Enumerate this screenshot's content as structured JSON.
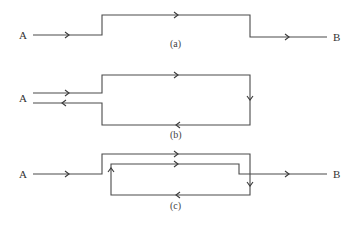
{
  "diagram": {
    "type": "circuit-path-diagram",
    "colors": {
      "line": "#4a4a4a",
      "text": "#333333",
      "background": "#ffffff"
    },
    "panels": [
      {
        "id": "a",
        "caption": "(a)",
        "start_label": "A",
        "end_label": "B",
        "description": "Single path from A stepping up, across the top, stepping down to B"
      },
      {
        "id": "b",
        "caption": "(b)",
        "start_label": "A",
        "description": "Closed loop: from A right along top, down right side, back along bottom to A"
      },
      {
        "id": "c",
        "caption": "(c)",
        "start_label": "A",
        "end_label": "B",
        "description": "Path from A across top to B, with inner loop doubling back along bottom and up"
      }
    ]
  }
}
